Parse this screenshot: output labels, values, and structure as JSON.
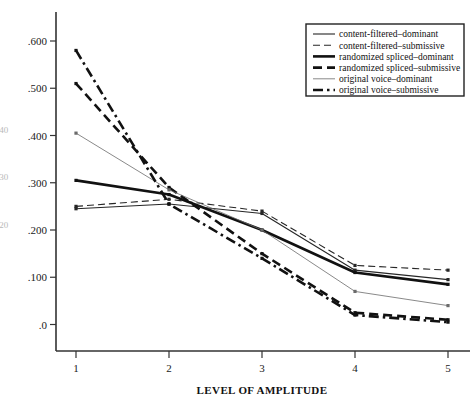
{
  "chart_data": {
    "type": "line",
    "title": "",
    "xlabel": "LEVEL OF AMPLITUDE",
    "ylabel": "",
    "categories": [
      "1",
      "2",
      "3",
      "4",
      "5"
    ],
    "x": [
      1,
      2,
      3,
      4,
      5
    ],
    "xlim": [
      0.6,
      5.4
    ],
    "ylim": [
      -0.03,
      0.655
    ],
    "grid": false,
    "legend_position": "top-right",
    "ytick_labels": [
      ".0",
      ".100",
      ".200",
      ".300",
      ".400",
      ".500",
      ".600"
    ],
    "ytick_values": [
      0.0,
      0.1,
      0.2,
      0.3,
      0.4,
      0.5,
      0.6
    ],
    "xtick_labels": [
      "1",
      "2",
      "3",
      "4",
      "5"
    ],
    "series": [
      {
        "name": "content-filtered–dominant",
        "style": "solid-thin",
        "color": "#262626",
        "values": [
          0.245,
          0.255,
          0.235,
          0.115,
          0.095
        ]
      },
      {
        "name": "content-filtered–submissive",
        "style": "dashed-thin",
        "color": "#262626",
        "values": [
          0.25,
          0.265,
          0.24,
          0.125,
          0.115
        ]
      },
      {
        "name": "randomized spliced–dominant",
        "style": "solid-thick",
        "color": "#111111",
        "values": [
          0.305,
          0.275,
          0.2,
          0.11,
          0.085
        ]
      },
      {
        "name": "randomized spliced–submissive",
        "style": "dashed-thick",
        "color": "#111111",
        "values": [
          0.51,
          0.29,
          0.15,
          0.025,
          0.01
        ]
      },
      {
        "name": "original voice–dominant",
        "style": "solid-hairline",
        "color": "#6b6b6b",
        "values": [
          0.405,
          0.285,
          0.2,
          0.07,
          0.04
        ]
      },
      {
        "name": "original voice–submissive",
        "style": "dashdot-thick",
        "color": "#111111",
        "values": [
          0.58,
          0.255,
          0.14,
          0.02,
          0.005
        ]
      }
    ],
    "edge_artifacts": [
      ".40",
      ".30",
      ".20"
    ]
  }
}
